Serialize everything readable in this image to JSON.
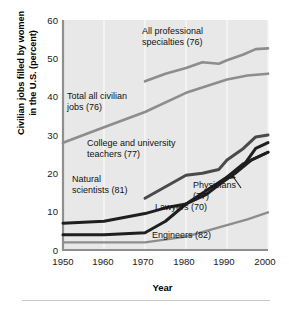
{
  "chart_data": {
    "type": "line",
    "title": "",
    "xlabel": "Year",
    "ylabel_line1": "Civilian jobs filled by women",
    "ylabel_line2": "in the U.S. (percent)",
    "xlim": [
      1950,
      2000
    ],
    "ylim": [
      0,
      60
    ],
    "xticks": [
      "1950",
      "1960",
      "1970",
      "1980",
      "1990",
      "2000"
    ],
    "yticks": [
      "0",
      "10",
      "20",
      "30",
      "40",
      "50",
      "60"
    ],
    "grid": "vertical-only",
    "legend": "inline-annotations",
    "series": [
      {
        "name": "All professional specialties (76)",
        "label": "All professional specialties (76)",
        "label_line1": "All professional",
        "label_line2": "specialties (76)",
        "color": "#8d8d8d",
        "x": [
          1970,
          1975,
          1980,
          1984,
          1988,
          1990,
          1994,
          1997,
          2000
        ],
        "values": [
          44.0,
          46.0,
          47.5,
          49.0,
          48.6,
          49.5,
          51.0,
          52.4,
          52.6
        ]
      },
      {
        "name": "Total all civilian jobs (76)",
        "label": "Total all civilian jobs (76)",
        "label_line1": "Total all civilian",
        "label_line2": "jobs (76)",
        "color": "#8d8d8d",
        "x": [
          1950,
          1960,
          1970,
          1980,
          1990,
          1995,
          2000
        ],
        "values": [
          28.0,
          32.0,
          36.0,
          41.0,
          44.5,
          45.5,
          46.0
        ]
      },
      {
        "name": "College and university teachers (77)",
        "label": "College and university teachers (77)",
        "label_line1": "College and university",
        "label_line2": "teachers (77)",
        "color": "#1f1f1f",
        "x": [
          1950,
          1960,
          1970,
          1975,
          1980,
          1985,
          1988,
          1992,
          1996,
          2000
        ],
        "values": [
          7.0,
          7.5,
          9.5,
          11.0,
          12.0,
          14.5,
          17.0,
          20.0,
          23.5,
          25.5
        ]
      },
      {
        "name": "Natural scientists (81)",
        "label": "Natural scientists (81)",
        "label_line1": "Natural",
        "label_line2": "scientists (81)",
        "color": "#4a4a4a",
        "x": [
          1970,
          1975,
          1980,
          1984,
          1988,
          1990,
          1994,
          1997,
          2000
        ],
        "values": [
          13.5,
          16.5,
          19.5,
          20.0,
          21.0,
          23.5,
          26.5,
          29.5,
          30.0
        ]
      },
      {
        "name": "Lawyers (70)",
        "label": "Lawyers (70)",
        "color": "#1f1f1f",
        "x": [
          1950,
          1960,
          1970,
          1975,
          1980,
          1985,
          1990,
          1994,
          1997,
          2000
        ],
        "values": [
          4.0,
          4.0,
          4.5,
          7.5,
          12.0,
          15.5,
          19.0,
          22.0,
          26.5,
          28.0
        ]
      },
      {
        "name": "Physicians (77)",
        "label": "Physicians (77)",
        "label_line1": "Physicians",
        "label_line2": "(77)",
        "color": "#1f1f1f",
        "x": [
          1988,
          1990,
          1994,
          1997,
          2000
        ],
        "values": [
          17.5,
          19.0,
          22.5,
          24.0,
          25.5
        ]
      },
      {
        "name": "Engineers (82)",
        "label": "Engineers (82)",
        "color": "#8d8d8d",
        "x": [
          1950,
          1960,
          1970,
          1980,
          1985,
          1990,
          1995,
          2000
        ],
        "values": [
          2.0,
          2.0,
          2.0,
          3.5,
          5.0,
          6.5,
          8.0,
          9.8
        ]
      }
    ]
  },
  "plot": {
    "background": "#e8e8e8",
    "axis_color": "#808080",
    "gridline_color": "#f5f5f5"
  }
}
